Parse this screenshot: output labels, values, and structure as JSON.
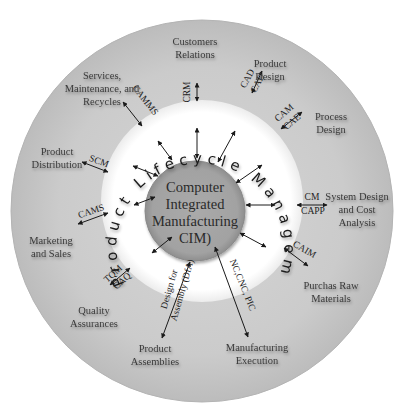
{
  "diagram": {
    "colors": {
      "outer_ring": "#c4c4c4",
      "middle_ring": "#ffffff",
      "core": "#a3a3a3",
      "text": "#333333"
    },
    "center": {
      "lines": [
        "Computer",
        "Integrated",
        "Manufacturing",
        "CIM)"
      ]
    },
    "ring_text": "Product Lifecycle Management (PLM)",
    "nodes": [
      {
        "id": "customers",
        "lines": [
          "Customers",
          "Relations"
        ],
        "abbr": [
          "CRM"
        ]
      },
      {
        "id": "product-design",
        "lines": [
          "Product",
          "Design"
        ],
        "abbr": [
          "CAD",
          "CAE"
        ]
      },
      {
        "id": "process-design",
        "lines": [
          "Process",
          "Design"
        ],
        "abbr": [
          "CAM",
          "CAE"
        ]
      },
      {
        "id": "system-design",
        "lines": [
          "System Design",
          "and Cost",
          "Analysis"
        ],
        "abbr": [
          "CM",
          "CAPP"
        ]
      },
      {
        "id": "raw-materials",
        "lines": [
          "Purchas Raw",
          "Materials"
        ],
        "abbr": [
          "CAIM"
        ]
      },
      {
        "id": "manufacturing-execution",
        "lines": [
          "Manufacturing",
          "Execution"
        ],
        "abbr": [
          "NC,CNC, PIC"
        ]
      },
      {
        "id": "product-assemblies",
        "lines": [
          "Product",
          "Assemblies"
        ],
        "abbr": [
          "Design for",
          "Assembly (DfA)"
        ]
      },
      {
        "id": "quality",
        "lines": [
          "Quality",
          "Assurances"
        ],
        "abbr": [
          "TQM",
          "CAQ"
        ]
      },
      {
        "id": "marketing",
        "lines": [
          "Marketing",
          "and Sales"
        ],
        "abbr": [
          "CAMS"
        ]
      },
      {
        "id": "distribution",
        "lines": [
          "Product",
          "Distribution"
        ],
        "abbr": [
          "SCM"
        ]
      },
      {
        "id": "services",
        "lines": [
          "Services,",
          "Maintenance, and",
          "Recycles"
        ],
        "abbr": [
          "CAMMS"
        ]
      }
    ]
  }
}
